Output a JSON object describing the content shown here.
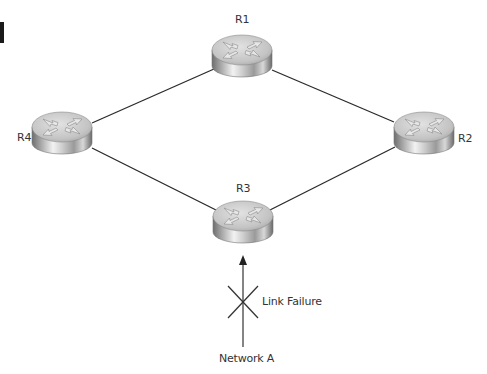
{
  "diagram": {
    "type": "network-topology",
    "colors": {
      "link": "#2a2a2a",
      "router_top": "#c8c8c8",
      "router_side_dark": "#7a7a7a",
      "router_side_light": "#f0f0f0",
      "label": "#333333",
      "failure_mark": "#333333"
    },
    "routers": [
      {
        "id": "R1",
        "label": "R1",
        "cx": 242,
        "cy": 50
      },
      {
        "id": "R2",
        "label": "R2",
        "cx": 424,
        "cy": 127
      },
      {
        "id": "R3",
        "label": "R3",
        "cx": 243,
        "cy": 215
      },
      {
        "id": "R4",
        "label": "R4",
        "cx": 62,
        "cy": 127
      }
    ],
    "links": [
      {
        "from": "R4",
        "to": "R1"
      },
      {
        "from": "R1",
        "to": "R2"
      },
      {
        "from": "R4",
        "to": "R3"
      },
      {
        "from": "R3",
        "to": "R2"
      }
    ],
    "failure": {
      "label": "Link Failure"
    },
    "network": {
      "label": "Network A"
    }
  }
}
